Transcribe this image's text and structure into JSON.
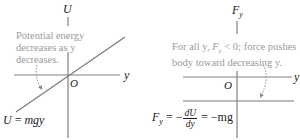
{
  "left_panel": {
    "vertical_axis_label": "U",
    "horizontal_axis_label": "y",
    "origin_label": "O",
    "annotation_lines": [
      "Potential energy",
      "decreases as y",
      "decreases."
    ],
    "equation": {
      "lhs": "U",
      "eq": "=",
      "rhs": "mgy"
    }
  },
  "right_panel": {
    "vertical_axis_label_main": "F",
    "vertical_axis_label_sub": "y",
    "horizontal_axis_label": "y",
    "origin_label": "O",
    "annotation_lines": [
      "For all y, Fᵧ < 0; force pushes",
      "body toward decreasing y."
    ],
    "annotation_parts": {
      "line1_a": "For all y, ",
      "line1_F": "F",
      "line1_sub": "y",
      "line1_b": " < 0; force pushes",
      "line2": "body toward decreasing y."
    },
    "equation": {
      "lhs_main": "F",
      "lhs_sub": "y",
      "eq1": "= −",
      "frac_num": "dU",
      "frac_den": "dy",
      "eq2": "= −mg"
    }
  },
  "colors": {
    "axis": "#808080",
    "line": "#7a7a7a",
    "annotation_text": "#9a9a9a",
    "label_text": "#1a1a1a"
  }
}
